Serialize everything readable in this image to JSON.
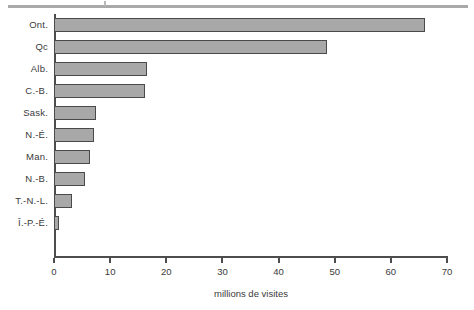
{
  "chart_data": {
    "type": "bar",
    "orientation": "horizontal",
    "title": "",
    "subtitle": "",
    "xlabel": "millions de visites",
    "ylabel": "",
    "xlim": [
      0,
      70
    ],
    "ylim": null,
    "grid": false,
    "legend": null,
    "xticks": [
      0,
      10,
      20,
      30,
      40,
      50,
      60,
      70
    ],
    "xticklabels": [
      "0",
      "10",
      "20",
      "30",
      "40",
      "50",
      "60",
      "70"
    ],
    "categories": [
      "Ont.",
      "Qc",
      "Alb.",
      "C.-B.",
      "Sask.",
      "N.-É.",
      "Man.",
      "N.-B.",
      "T.-N.-L.",
      "Î.-P.-É."
    ],
    "values": [
      66.0,
      48.7,
      16.6,
      16.2,
      7.5,
      7.1,
      6.4,
      5.5,
      3.2,
      0.9
    ],
    "series": [
      {
        "name": "millions de visites",
        "values": [
          66.0,
          48.7,
          16.6,
          16.2,
          7.5,
          7.1,
          6.4,
          5.5,
          3.2,
          0.9
        ]
      }
    ],
    "bar_fill_color": "#a8a8a8",
    "bar_edge_color": "#4a4a4a",
    "axis_color": "#4d4d4d",
    "rule_color": "#a9a9a9"
  },
  "decor": {
    "top_rule": ""
  }
}
